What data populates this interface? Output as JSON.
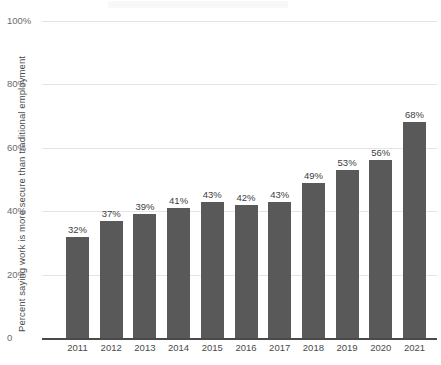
{
  "chart_data": {
    "type": "bar",
    "title": "",
    "xlabel": "",
    "ylabel": "Percent saying work is more secure than traditional employment",
    "categories": [
      "2011",
      "2012",
      "2013",
      "2014",
      "2015",
      "2016",
      "2017",
      "2018",
      "2019",
      "2020",
      "2021"
    ],
    "values": [
      32,
      37,
      39,
      41,
      43,
      42,
      43,
      49,
      53,
      56,
      68
    ],
    "value_labels": [
      "32%",
      "37%",
      "39%",
      "41%",
      "43%",
      "42%",
      "43%",
      "49%",
      "53%",
      "56%",
      "68%"
    ],
    "ylim": [
      0,
      100
    ],
    "yticks": [
      0,
      20,
      40,
      60,
      80,
      100
    ],
    "ytick_labels": [
      "0",
      "20%",
      "40%",
      "60%",
      "80%",
      "100%"
    ],
    "grid": true,
    "legend": "none",
    "bar_color": "#595959",
    "gridline_color": "#e4e4e4",
    "axis_color": "#4a4a4a",
    "background_color": "#ffffff"
  }
}
